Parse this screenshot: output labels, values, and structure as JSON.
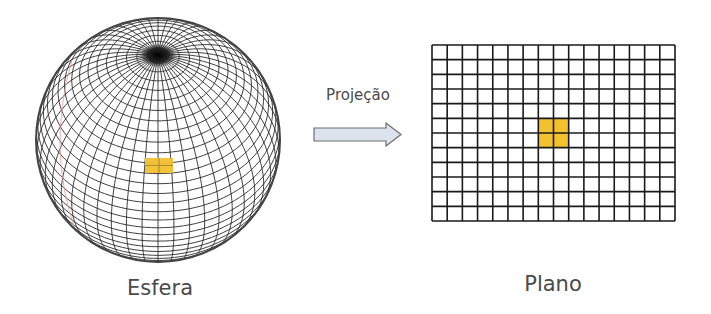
{
  "sphere": {
    "label": "Esfera",
    "center": [
      158,
      140
    ],
    "radius": 123,
    "highlight_color": "#f2c12e"
  },
  "projection": {
    "label": "Projeção",
    "arrow_fill": "#dde3ec",
    "arrow_stroke": "#6b6f75"
  },
  "plane": {
    "label": "Plano",
    "columns": 16,
    "rows": 12,
    "highlight_cells": [
      [
        7,
        5
      ],
      [
        8,
        5
      ],
      [
        7,
        6
      ],
      [
        8,
        6
      ]
    ],
    "highlight_color": "#f2c12e",
    "line_color": "#1a1a1a"
  }
}
